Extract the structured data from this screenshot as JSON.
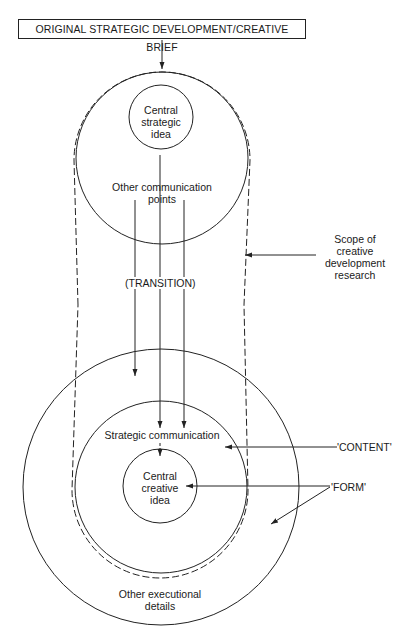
{
  "title": "ORIGINAL STRATEGIC DEVELOPMENT/CREATIVE BRIEF",
  "top_circle": {
    "inner_label": [
      "Central",
      "strategic",
      "idea"
    ],
    "outer_label": [
      "Other communication",
      "points"
    ]
  },
  "transition_label": "(TRANSITION)",
  "scope_label": [
    "Scope of",
    "creative",
    "development",
    "research"
  ],
  "bottom_circle": {
    "middle_label": "Strategic communication",
    "inner_label": [
      "Central",
      "creative",
      "idea"
    ],
    "outer_label": [
      "Other executional",
      "details"
    ]
  },
  "annotations": {
    "content": "'CONTENT'",
    "form": "'FORM'"
  },
  "colors": {
    "line": "#222222",
    "background": "#ffffff"
  }
}
